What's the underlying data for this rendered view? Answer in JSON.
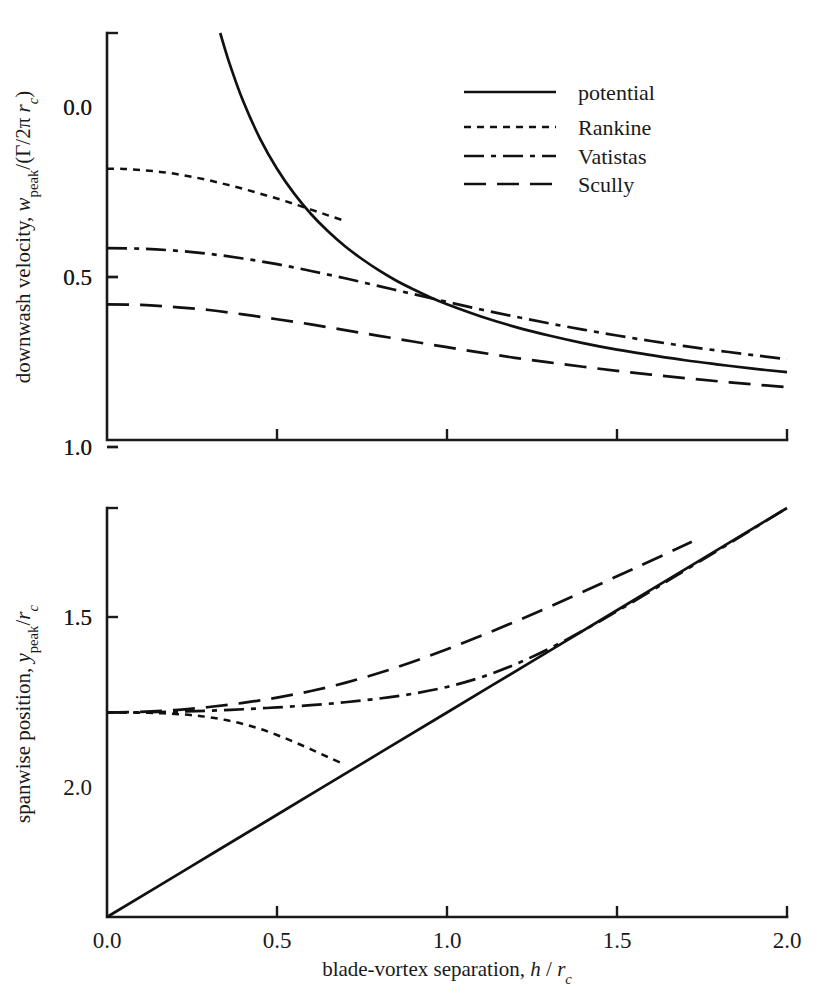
{
  "figure": {
    "background": "#ffffff",
    "ink_color": "#111111"
  },
  "legend": {
    "position": "top-right-inside-upper-panel",
    "items": [
      {
        "label": "potential",
        "style": "solid"
      },
      {
        "label": "Rankine",
        "style": "dotted"
      },
      {
        "label": "Vatistas",
        "style": "dash-dot"
      },
      {
        "label": "Scully",
        "style": "dashed"
      }
    ]
  },
  "axis_text": {
    "x_label_plain": "blade-vortex separation,",
    "x_label_symbol_main": "h",
    "x_label_symbol_slash": "/",
    "x_label_symbol_r": "r",
    "x_label_symbol_rsub": "c",
    "top_y_label_plain": "downwash velocity,",
    "top_y_label_w": "w",
    "top_y_label_wsub": "peak",
    "top_y_label_mid": "/(Γ/2π",
    "top_y_label_r": " r",
    "top_y_label_rsub": "c",
    "top_y_label_close": ")",
    "bottom_y_label_plain": "spanwise position,",
    "bottom_y_label_y": "y",
    "bottom_y_label_ysub": "peak",
    "bottom_y_label_slash": "/",
    "bottom_y_label_r": "r",
    "bottom_y_label_rsub": "c"
  },
  "chart_data": [
    {
      "id": "upper-panel",
      "type": "line",
      "title": "",
      "xlabel": "blade-vortex separation, h / r_c",
      "ylabel": "downwash velocity, w_peak/(Γ/2π r_c)",
      "xlim": [
        0.0,
        2.0
      ],
      "ylim": [
        0.0,
        1.5
      ],
      "xticks": [
        0.0,
        0.5,
        1.0,
        1.5,
        2.0
      ],
      "xticklabels": [
        "0.0",
        "0.5",
        "1.0",
        "1.5",
        "2.0"
      ],
      "yticks": [
        0.0,
        0.5,
        1.0,
        1.5
      ],
      "yticklabels": [
        "0.0",
        "0.5",
        "1.0",
        "1.5"
      ],
      "grid": false,
      "legend": "upper right",
      "series": [
        {
          "name": "potential",
          "style": "solid",
          "x": [
            0.333,
            0.36,
            0.4,
            0.45,
            0.5,
            0.55,
            0.6,
            0.65,
            0.7,
            0.75,
            0.8,
            0.85,
            0.9,
            0.95,
            1.0,
            1.1,
            1.2,
            1.3,
            1.4,
            1.5,
            1.6,
            1.7,
            1.8,
            1.9,
            2.0
          ],
          "y": [
            1.5,
            1.389,
            1.25,
            1.111,
            1.0,
            0.909,
            0.833,
            0.769,
            0.714,
            0.667,
            0.625,
            0.588,
            0.556,
            0.526,
            0.5,
            0.455,
            0.417,
            0.385,
            0.357,
            0.333,
            0.313,
            0.294,
            0.278,
            0.263,
            0.25
          ]
        },
        {
          "name": "Rankine",
          "style": "dotted",
          "x": [
            0.0,
            0.05,
            0.1,
            0.15,
            0.2,
            0.25,
            0.3,
            0.35,
            0.4,
            0.45,
            0.5,
            0.55,
            0.6,
            0.65,
            0.7
          ],
          "y": [
            1.0,
            0.999,
            0.995,
            0.989,
            0.981,
            0.97,
            0.957,
            0.942,
            0.926,
            0.908,
            0.89,
            0.87,
            0.849,
            0.828,
            0.807
          ]
        },
        {
          "name": "Vatistas",
          "style": "dash-dot",
          "x": [
            0.0,
            0.1,
            0.2,
            0.3,
            0.4,
            0.5,
            0.6,
            0.7,
            0.8,
            0.9,
            1.0,
            1.1,
            1.2,
            1.3,
            1.4,
            1.5,
            1.6,
            1.7,
            1.8,
            1.9,
            2.0
          ],
          "y": [
            0.707,
            0.705,
            0.698,
            0.686,
            0.669,
            0.648,
            0.623,
            0.596,
            0.567,
            0.538,
            0.509,
            0.481,
            0.455,
            0.43,
            0.407,
            0.385,
            0.365,
            0.346,
            0.329,
            0.313,
            0.298
          ]
        },
        {
          "name": "Scully",
          "style": "dashed",
          "x": [
            0.0,
            0.1,
            0.2,
            0.3,
            0.4,
            0.5,
            0.6,
            0.7,
            0.8,
            0.9,
            1.0,
            1.1,
            1.2,
            1.3,
            1.4,
            1.5,
            1.6,
            1.7,
            1.8,
            1.9,
            2.0
          ],
          "y": [
            0.5,
            0.498,
            0.49,
            0.479,
            0.463,
            0.445,
            0.426,
            0.405,
            0.384,
            0.363,
            0.342,
            0.322,
            0.303,
            0.286,
            0.27,
            0.255,
            0.241,
            0.228,
            0.216,
            0.205,
            0.195
          ]
        }
      ]
    },
    {
      "id": "lower-panel",
      "type": "line",
      "title": "",
      "xlabel": "blade-vortex separation, h / r_c",
      "ylabel": "spanwise position, y_peak/r_c",
      "xlim": [
        0.0,
        2.0
      ],
      "ylim": [
        0.0,
        2.0
      ],
      "xticks": [
        0.0,
        0.5,
        1.0,
        1.5,
        2.0
      ],
      "xticklabels": [
        "0.0",
        "0.5",
        "1.0",
        "1.5",
        "2.0"
      ],
      "yticks": [
        0.0,
        0.5,
        1.0,
        1.5,
        2.0
      ],
      "yticklabels": [
        "0.0",
        "0.5",
        "1.0",
        "1.5",
        "2.0"
      ],
      "grid": false,
      "legend": "none",
      "series": [
        {
          "name": "potential",
          "style": "solid",
          "x": [
            0.0,
            0.25,
            0.5,
            0.75,
            1.0,
            1.25,
            1.5,
            1.75,
            2.0
          ],
          "y": [
            0.0,
            0.25,
            0.5,
            0.75,
            1.0,
            1.25,
            1.5,
            1.75,
            2.0
          ]
        },
        {
          "name": "Rankine",
          "style": "dotted",
          "x": [
            0.0,
            0.05,
            0.1,
            0.15,
            0.2,
            0.25,
            0.3,
            0.35,
            0.4,
            0.45,
            0.5,
            0.55,
            0.6,
            0.65,
            0.7
          ],
          "y": [
            1.0,
            1.0,
            0.999,
            0.997,
            0.993,
            0.987,
            0.977,
            0.963,
            0.944,
            0.92,
            0.89,
            0.856,
            0.82,
            0.782,
            0.745
          ]
        },
        {
          "name": "Vatistas",
          "style": "dash-dot",
          "x": [
            0.0,
            0.1,
            0.2,
            0.3,
            0.4,
            0.5,
            0.6,
            0.7,
            0.8,
            0.9,
            1.0,
            1.1,
            1.2,
            1.3,
            1.4,
            1.5,
            1.6,
            1.7,
            1.8,
            1.9,
            2.0
          ],
          "y": [
            1.0,
            1.001,
            1.004,
            1.009,
            1.016,
            1.025,
            1.036,
            1.05,
            1.068,
            1.092,
            1.125,
            1.172,
            1.235,
            1.312,
            1.4,
            1.495,
            1.594,
            1.695,
            1.796,
            1.898,
            2.0
          ]
        },
        {
          "name": "Scully",
          "style": "dashed",
          "x": [
            0.0,
            0.1,
            0.2,
            0.3,
            0.4,
            0.5,
            0.6,
            0.7,
            0.8,
            0.9,
            1.0,
            1.1,
            1.2,
            1.3,
            1.4,
            1.5,
            1.6,
            1.72
          ],
          "y": [
            1.0,
            1.003,
            1.012,
            1.027,
            1.047,
            1.073,
            1.105,
            1.145,
            1.193,
            1.248,
            1.309,
            1.375,
            1.444,
            1.516,
            1.59,
            1.666,
            1.742,
            1.835
          ]
        }
      ]
    }
  ]
}
